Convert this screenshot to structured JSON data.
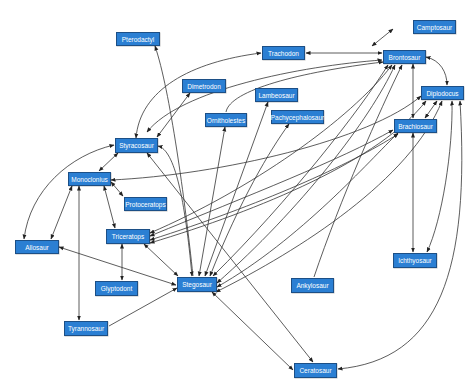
{
  "diagram": {
    "type": "directed-graph",
    "node_fill": "#2b7fd3",
    "node_border": "#1c4f86",
    "edge_color": "#333333",
    "nodes": [
      {
        "id": "pterodactyl",
        "label": "Pterodactyl",
        "x": 116,
        "y": 32,
        "w": 44,
        "h": 14
      },
      {
        "id": "camptosaur",
        "label": "Camptosaur",
        "x": 413,
        "y": 20,
        "w": 43,
        "h": 14
      },
      {
        "id": "trachodon",
        "label": "Trachodon",
        "x": 262,
        "y": 46,
        "w": 43,
        "h": 14
      },
      {
        "id": "brontosaur",
        "label": "Brontosaur",
        "x": 383,
        "y": 50,
        "w": 43,
        "h": 14
      },
      {
        "id": "dimetrodon",
        "label": "Dimetrodon",
        "x": 182,
        "y": 79,
        "w": 44,
        "h": 14
      },
      {
        "id": "lambeosaur",
        "label": "Lambeosaur",
        "x": 255,
        "y": 88,
        "w": 43,
        "h": 14
      },
      {
        "id": "diplodocus",
        "label": "Diplodocus",
        "x": 421,
        "y": 86,
        "w": 43,
        "h": 14
      },
      {
        "id": "ornitholestes",
        "label": "Ornitholestes",
        "x": 205,
        "y": 113,
        "w": 42,
        "h": 14
      },
      {
        "id": "pachycephalosaur",
        "label": "Pachycephalosaur",
        "x": 271,
        "y": 110,
        "w": 53,
        "h": 14
      },
      {
        "id": "brachiosaur",
        "label": "Brachiosaur",
        "x": 394,
        "y": 119,
        "w": 43,
        "h": 14
      },
      {
        "id": "styracosaur",
        "label": "Styracosaur",
        "x": 115,
        "y": 138,
        "w": 43,
        "h": 15
      },
      {
        "id": "monoclonius",
        "label": "Monoclonius",
        "x": 68,
        "y": 172,
        "w": 43,
        "h": 14
      },
      {
        "id": "protoceratops",
        "label": "Protoceratops",
        "x": 124,
        "y": 197,
        "w": 43,
        "h": 14
      },
      {
        "id": "triceratops",
        "label": "Triceratops",
        "x": 106,
        "y": 229,
        "w": 44,
        "h": 15
      },
      {
        "id": "allosaur",
        "label": "Allosaur",
        "x": 15,
        "y": 240,
        "w": 44,
        "h": 14
      },
      {
        "id": "ichthyosaur",
        "label": "Ichthyosaur",
        "x": 393,
        "y": 253,
        "w": 44,
        "h": 15
      },
      {
        "id": "glyptodont",
        "label": "Glyptodont",
        "x": 95,
        "y": 281,
        "w": 43,
        "h": 15
      },
      {
        "id": "stegosaur",
        "label": "Stegosaur",
        "x": 177,
        "y": 277,
        "w": 40,
        "h": 15
      },
      {
        "id": "ankylosaur",
        "label": "Ankylosaur",
        "x": 291,
        "y": 278,
        "w": 43,
        "h": 15
      },
      {
        "id": "tyrannosaur",
        "label": "Tyrannosaur",
        "x": 64,
        "y": 321,
        "w": 44,
        "h": 15
      },
      {
        "id": "ceratosaur",
        "label": "Ceratosaur",
        "x": 294,
        "y": 363,
        "w": 43,
        "h": 15
      }
    ],
    "edges": [
      {
        "from": "brontosaur",
        "to": "camptosaur",
        "bidirectional": true,
        "d": "M 372 46 L 393 29"
      },
      {
        "from": "trachodon",
        "to": "brontosaur",
        "bidirectional": true,
        "d": "M 306 53 L 382 53"
      },
      {
        "from": "styracosaur",
        "to": "trachodon",
        "bidirectional": true,
        "d": "M 136 138 C 140 90, 190 62, 261 53"
      },
      {
        "from": "stegosaur",
        "to": "brontosaur",
        "bidirectional": true,
        "d": "M 147 132 C 180 90, 300 66, 382 60"
      },
      {
        "from": "ornitholestes",
        "to": "brontosaur",
        "bidirectional": false,
        "d": "M 226 112 C 230 90, 300 72, 383 62"
      },
      {
        "from": "brontosaur",
        "to": "diplodocus",
        "bidirectional": true,
        "d": "M 426 57 C 440 60, 447 72, 447 85"
      },
      {
        "from": "brontosaur",
        "to": "brachiosaur",
        "bidirectional": true,
        "d": "M 413 64 L 413 118"
      },
      {
        "from": "diplodocus",
        "to": "brachiosaur",
        "bidirectional": true,
        "d": "M 437 101 L 425 118"
      },
      {
        "from": "styracosaur",
        "to": "pterodactyl",
        "bidirectional": false,
        "d": "M 193 276 C 185 200, 170 90, 155 46"
      },
      {
        "from": "styracosaur",
        "to": "dimetrodon",
        "bidirectional": true,
        "d": "M 157 137 L 190 93"
      },
      {
        "from": "monoclonius",
        "to": "styracosaur",
        "bidirectional": true,
        "d": "M 99 171 L 118 153"
      },
      {
        "from": "allosaur",
        "to": "styracosaur",
        "bidirectional": true,
        "d": "M 24 239 C 30 190, 70 155, 114 145"
      },
      {
        "from": "monoclonius",
        "to": "protoceratops",
        "bidirectional": true,
        "d": "M 111 182 L 123 196"
      },
      {
        "from": "monoclonius",
        "to": "allosaur",
        "bidirectional": true,
        "d": "M 72 186 L 51 239"
      },
      {
        "from": "monoclonius",
        "to": "tyrannosaur",
        "bidirectional": true,
        "d": "M 79 186 L 79 320"
      },
      {
        "from": "monoclonius",
        "to": "triceratops",
        "bidirectional": true,
        "d": "M 104 186 L 115 228"
      },
      {
        "from": "triceratops",
        "to": "glyptodont",
        "bidirectional": true,
        "d": "M 122 244 L 122 280"
      },
      {
        "from": "allosaur",
        "to": "stegosaur",
        "bidirectional": true,
        "d": "M 59 247 L 176 285"
      },
      {
        "from": "triceratops",
        "to": "stegosaur",
        "bidirectional": true,
        "d": "M 144 244 L 178 276"
      },
      {
        "from": "tyrannosaur",
        "to": "stegosaur",
        "bidirectional": false,
        "d": "M 109 326 L 177 288"
      },
      {
        "from": "styracosaur",
        "to": "stegosaur",
        "bidirectional": true,
        "d": "M 158 146 C 175 150, 185 200, 192 276"
      },
      {
        "from": "stegosaur",
        "to": "ornitholestes",
        "bidirectional": true,
        "d": "M 199 276 L 225 127"
      },
      {
        "from": "stegosaur",
        "to": "lambeosaur",
        "bidirectional": true,
        "d": "M 205 276 L 268 102"
      },
      {
        "from": "stegosaur",
        "to": "pachycephalosaur",
        "bidirectional": true,
        "d": "M 210 276 C 240 200, 270 150, 289 124"
      },
      {
        "from": "stegosaur",
        "to": "brontosaur",
        "bidirectional": true,
        "d": "M 213 276 C 290 200, 360 110, 388 65"
      },
      {
        "from": "stegosaur",
        "to": "brontosaur",
        "bidirectional": true,
        "d": "M 217 283 C 300 210, 370 120, 395 65"
      },
      {
        "from": "stegosaur",
        "to": "brachiosaur",
        "bidirectional": true,
        "d": "M 217 287 C 300 240, 370 160, 398 133"
      },
      {
        "from": "stegosaur",
        "to": "diplodocus",
        "bidirectional": true,
        "d": "M 216 292 C 300 250, 410 180, 442 101"
      },
      {
        "from": "stegosaur",
        "to": "ceratosaur",
        "bidirectional": true,
        "d": "M 212 292 L 293 370"
      },
      {
        "from": "styracosaur",
        "to": "ceratosaur",
        "bidirectional": true,
        "d": "M 147 153 L 313 362"
      },
      {
        "from": "ceratosaur",
        "to": "diplodocus",
        "bidirectional": true,
        "d": "M 338 369 C 440 360, 470 270, 460 101"
      },
      {
        "from": "monoclonius",
        "to": "diplodocus",
        "bidirectional": true,
        "d": "M 111 180 C 220 175, 370 140, 421 96"
      },
      {
        "from": "triceratops",
        "to": "brontosaur",
        "bidirectional": true,
        "d": "M 150 233 C 250 190, 350 120, 392 65"
      },
      {
        "from": "triceratops",
        "to": "brachiosaur",
        "bidirectional": true,
        "d": "M 150 236 C 250 195, 340 160, 393 130"
      },
      {
        "from": "triceratops",
        "to": "brachiosaur",
        "bidirectional": true,
        "d": "M 150 240 C 260 205, 350 165, 398 134"
      },
      {
        "from": "triceratops",
        "to": "diplodocus",
        "bidirectional": true,
        "d": "M 150 243 C 260 210, 380 160, 426 101"
      },
      {
        "from": "ankylosaur",
        "to": "brontosaur",
        "bidirectional": false,
        "d": "M 314 277 C 340 200, 380 110, 402 65"
      },
      {
        "from": "brachiosaur",
        "to": "ichthyosaur",
        "bidirectional": true,
        "d": "M 413 133 L 413 252"
      },
      {
        "from": "ichthyosaur",
        "to": "diplodocus",
        "bidirectional": true,
        "d": "M 427 252 C 442 220, 453 150, 452 101"
      }
    ]
  }
}
